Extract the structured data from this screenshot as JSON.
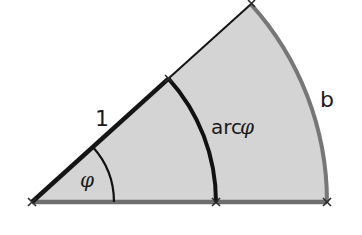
{
  "diagram": {
    "type": "circular-sector",
    "colors": {
      "fill": "#d4d4d4",
      "outer_arc": "#777777",
      "base_line": "#6e6e6e",
      "inner_arc": "#111111",
      "radius_line": "#151515",
      "marker": "#2a2a2a"
    },
    "labels": {
      "unit_radius": "1",
      "angle": "φ",
      "arc_label_prefix": "arc",
      "arc_label_symbol": "φ",
      "outer_arc": "b"
    }
  }
}
